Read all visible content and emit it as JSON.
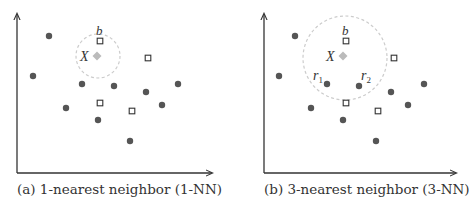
{
  "colors": {
    "axis": "#333333",
    "dot": "#555555",
    "square_stroke": "#333333",
    "query": "#bbbbbb",
    "circle": "#cccccc",
    "text": "#333333"
  },
  "panels": [
    {
      "id": "a",
      "caption": "(a) 1-nearest neighbor (1-NN)",
      "query_label": "X",
      "neighbor_labels": {
        "b": "b"
      },
      "axis": {
        "x0": 17,
        "y0": 173,
        "ytop": 14,
        "xright": 212
      },
      "query": {
        "x": 97,
        "y": 56
      },
      "circle": {
        "cx": 98,
        "cy": 56,
        "r": 22
      },
      "dots": [
        [
          49,
          36
        ],
        [
          33,
          76
        ],
        [
          82,
          84
        ],
        [
          114,
          86
        ],
        [
          146,
          92
        ],
        [
          178,
          84
        ],
        [
          66,
          108
        ],
        [
          162,
          105
        ],
        [
          98,
          120
        ],
        [
          130,
          141
        ]
      ],
      "squares": [
        [
          100,
          41
        ],
        [
          148,
          58
        ],
        [
          100,
          103
        ],
        [
          132,
          111
        ]
      ],
      "labels": [
        {
          "text": "b",
          "x": 96,
          "y": 35,
          "size": 13
        },
        {
          "text": "X",
          "x": 80,
          "y": 61,
          "size": 14
        }
      ],
      "caption_pos": {
        "x": 17,
        "y": 194
      }
    },
    {
      "id": "b",
      "caption": "(b) 3-nearest neighbor (3-NN)",
      "query_label": "X",
      "axis": {
        "x0": 264,
        "y0": 173,
        "ytop": 14,
        "xright": 456
      },
      "query": {
        "x": 343,
        "y": 56
      },
      "circle": {
        "cx": 345,
        "cy": 58,
        "r": 42
      },
      "dots": [
        [
          295,
          36
        ],
        [
          279,
          76
        ],
        [
          327,
          84
        ],
        [
          359,
          86
        ],
        [
          391,
          92
        ],
        [
          424,
          84
        ],
        [
          311,
          108
        ],
        [
          408,
          105
        ],
        [
          343,
          120
        ],
        [
          376,
          141
        ]
      ],
      "squares": [
        [
          346,
          41
        ],
        [
          394,
          58
        ],
        [
          346,
          103
        ],
        [
          378,
          111
        ]
      ],
      "labels": [
        {
          "text": "b",
          "x": 342,
          "y": 35,
          "size": 13
        },
        {
          "text": "X",
          "x": 326,
          "y": 61,
          "size": 14
        },
        {
          "text": "r",
          "x": 313,
          "y": 80,
          "size": 14,
          "sub": "1"
        },
        {
          "text": "r",
          "x": 361,
          "y": 80,
          "size": 14,
          "sub": "2"
        }
      ],
      "caption_pos": {
        "x": 264,
        "y": 194
      }
    }
  ]
}
